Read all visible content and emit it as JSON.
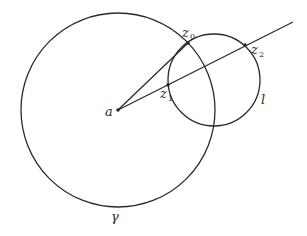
{
  "diagram": {
    "labels": {
      "a": "a",
      "z0": "z",
      "z0_sub": "0",
      "z1": "z",
      "z1_sub": "1",
      "z2": "z",
      "z2_sub": "2",
      "l": "l",
      "gamma": "γ"
    },
    "elements": {
      "circle_gamma": {
        "cx": 118,
        "cy": 110,
        "r": 97
      },
      "circle_l": {
        "cx": 214,
        "cy": 80,
        "r": 46
      },
      "point_a": {
        "x": 118,
        "y": 110
      },
      "point_z0": {
        "x": 188,
        "y": 43
      },
      "point_z1": {
        "x": 168,
        "y": 85
      },
      "point_z2": {
        "x": 245,
        "y": 45
      },
      "ray_end": {
        "x": 293,
        "y": 22
      }
    },
    "colors": {
      "stroke": "#2a2a2a",
      "background": "#ffffff"
    }
  }
}
